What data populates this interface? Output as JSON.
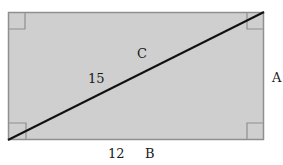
{
  "figure": {
    "shape": "rectangle",
    "fill_color": "#cfcfcf",
    "border_color": "#8f8f8f",
    "diagonal_color": "#111111",
    "right_angle_markers": 4,
    "labels": {
      "diagonal_letter": "C",
      "diagonal_length": "15",
      "side_right": "A",
      "bottom_length": "12",
      "bottom_letter": "B"
    }
  }
}
